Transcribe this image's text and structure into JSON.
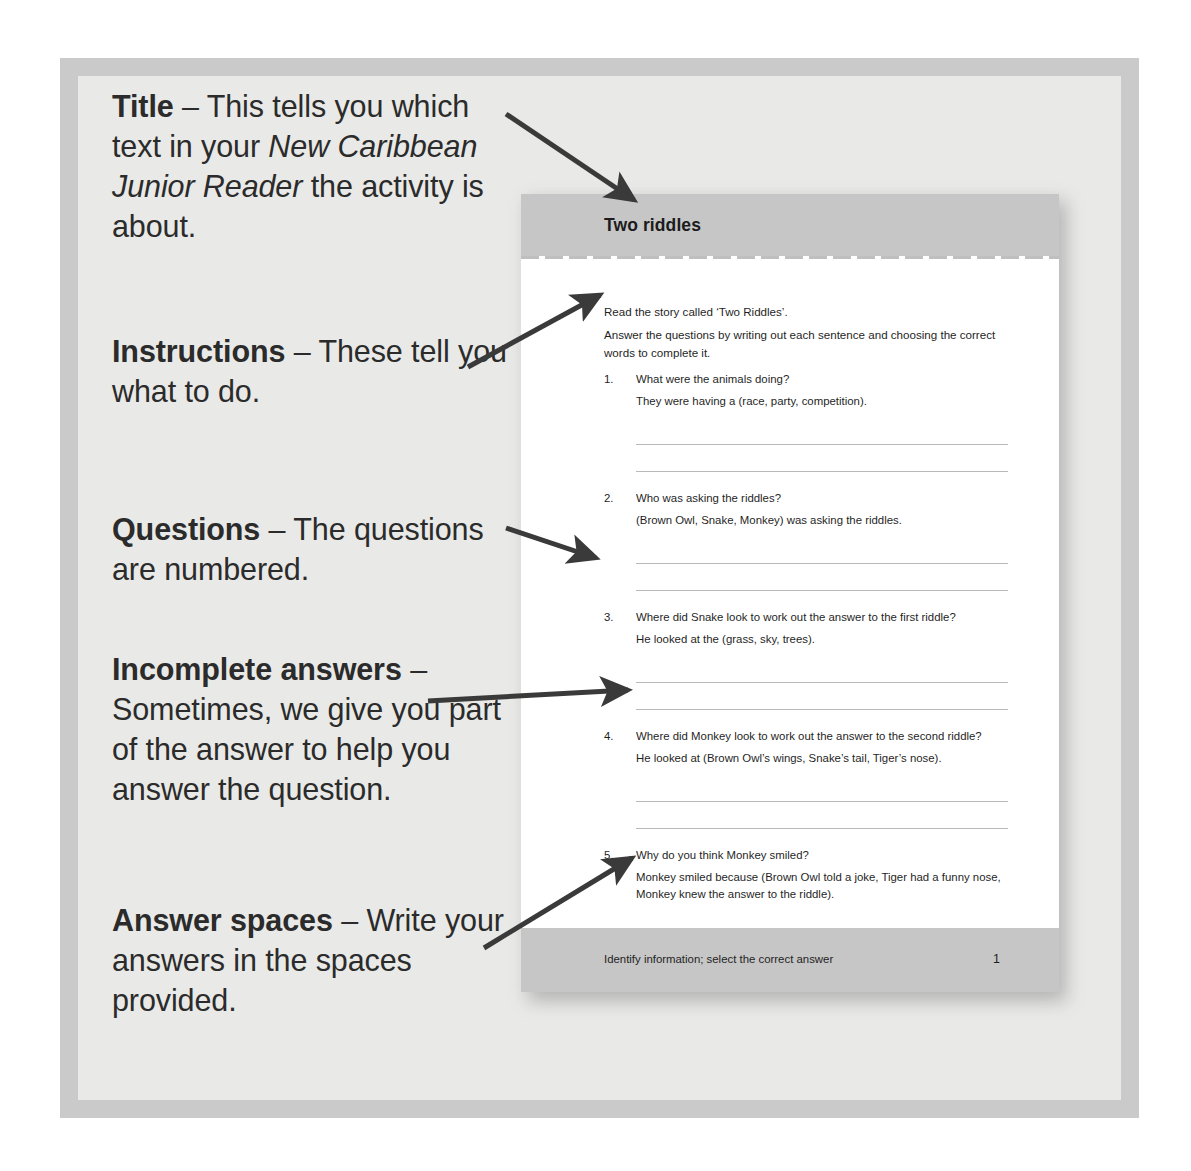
{
  "annotations": [
    {
      "id": "title",
      "label": "Title",
      "dash": " – ",
      "body_before_italic": "This tells you which text in your ",
      "italic": "New Caribbean Junior Reader",
      "body_after_italic": " the activity is about.",
      "full_text": "Title – This tells you which text in your New Caribbean Junior Reader the activity is about."
    },
    {
      "id": "instructions",
      "label": "Instructions",
      "dash": " – ",
      "body": "These tell you what to do.",
      "full_text": "Instructions – These tell you what to do."
    },
    {
      "id": "questions",
      "label": "Questions",
      "dash": " – ",
      "body": "The questions are numbered.",
      "full_text": "Questions – The questions are numbered."
    },
    {
      "id": "incomplete-answers",
      "label": "Incomplete answers",
      "dash": " – ",
      "body": "Sometimes, we give you part of the answer to help you answer the question.",
      "full_text": "Incomplete answers – Sometimes, we give you part of the answer to help you answer the question."
    },
    {
      "id": "answer-spaces",
      "label": "Answer spaces",
      "dash": " – ",
      "body": "Write your answers in the spaces provided.",
      "full_text": "Answer spaces – Write your answers in the spaces provided."
    }
  ],
  "arrows": [
    {
      "name": "arrow-to-title",
      "x1": 506,
      "y1": 114,
      "x2": 634,
      "y2": 200
    },
    {
      "name": "arrow-to-instructions",
      "x1": 468,
      "y1": 367,
      "x2": 600,
      "y2": 295
    },
    {
      "name": "arrow-to-questions",
      "x1": 506,
      "y1": 528,
      "x2": 596,
      "y2": 558
    },
    {
      "name": "arrow-to-incomplete",
      "x1": 428,
      "y1": 701,
      "x2": 628,
      "y2": 690
    },
    {
      "name": "arrow-to-answer-spaces",
      "x1": 484,
      "y1": 948,
      "x2": 632,
      "y2": 858
    }
  ],
  "worksheet": {
    "title": "Two riddles",
    "instructions": {
      "line1": "Read the story called ‘Two Riddles’.",
      "line2": "Answer the questions by writing out each sentence and choosing the correct words to complete it."
    },
    "questions": [
      {
        "number": "1.",
        "prompt": "What were the animals doing?",
        "stem": "They were having a (race, party, competition).",
        "answer_lines": 2
      },
      {
        "number": "2.",
        "prompt": "Who was asking the riddles?",
        "stem": "(Brown Owl, Snake, Monkey) was asking the riddles.",
        "answer_lines": 2
      },
      {
        "number": "3.",
        "prompt": "Where did Snake look to work out the answer to the first riddle?",
        "stem": "He looked at the (grass, sky, trees).",
        "answer_lines": 2
      },
      {
        "number": "4.",
        "prompt": "Where did Monkey look to work out the answer to the second riddle?",
        "stem": "He looked at (Brown Owl’s wings, Snake’s tail, Tiger’s nose).",
        "answer_lines": 2
      },
      {
        "number": "5.",
        "prompt": "Why do you think Monkey smiled?",
        "stem": "Monkey smiled because (Brown Owl told a joke, Tiger had a funny nose, Monkey knew the answer to the riddle).",
        "answer_lines": 2
      }
    ],
    "footer": {
      "objective": "Identify information; select the correct answer",
      "page_number": "1"
    }
  },
  "colors": {
    "page_background": "#ffffff",
    "frame_outer": "#c9cac9",
    "frame_inner": "#e9e9e7",
    "worksheet_background": "#ffffff",
    "worksheet_band": "#c6c6c6",
    "answer_line": "#b9b9b9",
    "text": "#1f1f1f",
    "annotation_text": "#2b2b2b",
    "arrow": "#3a3a3a"
  }
}
